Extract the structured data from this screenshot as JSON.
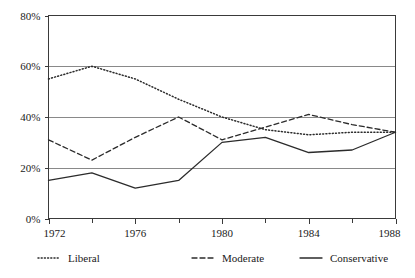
{
  "chart_data": {
    "type": "line",
    "title": "",
    "subtitle": "",
    "xlabel": "",
    "ylabel": "",
    "x": [
      1972,
      1974,
      1976,
      1978,
      1980,
      1982,
      1984,
      1986,
      1988
    ],
    "xlim": [
      1972,
      1988
    ],
    "ylim": [
      0,
      80
    ],
    "grid": true,
    "legend_position": "bottom",
    "x_tick_labels": [
      "1972",
      "1976",
      "1980",
      "1984",
      "1988"
    ],
    "x_tick_values": [
      1972,
      1976,
      1980,
      1984,
      1988
    ],
    "x_minor_tick_values": [
      1974,
      1978,
      1982,
      1986
    ],
    "y_tick_labels": [
      "0%",
      "20%",
      "40%",
      "60%",
      "80%"
    ],
    "y_tick_values": [
      0,
      20,
      40,
      60,
      80
    ],
    "series": [
      {
        "name": "Liberal",
        "style": "dotted",
        "color": "#2b2b2b",
        "values": [
          55,
          60,
          55,
          47,
          40,
          35,
          33,
          34,
          34
        ]
      },
      {
        "name": "Moderate",
        "style": "dashed",
        "color": "#2b2b2b",
        "values": [
          31,
          23,
          32,
          40,
          31,
          36,
          41,
          37,
          34
        ]
      },
      {
        "name": "Conservative",
        "style": "solid",
        "color": "#2b2b2b",
        "values": [
          15,
          18,
          12,
          15,
          30,
          32,
          26,
          27,
          34
        ]
      }
    ]
  },
  "legend": {
    "items": [
      {
        "label": "Liberal",
        "style": "dotted"
      },
      {
        "label": "Moderate",
        "style": "dashed"
      },
      {
        "label": "Conservative",
        "style": "solid"
      }
    ]
  }
}
